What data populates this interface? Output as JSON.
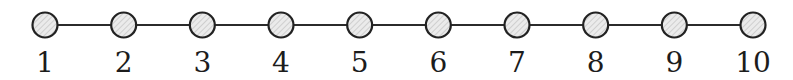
{
  "diagram": {
    "type": "path-graph",
    "nodes": [
      {
        "id": 1,
        "label": "1"
      },
      {
        "id": 2,
        "label": "2"
      },
      {
        "id": 3,
        "label": "3"
      },
      {
        "id": 4,
        "label": "4"
      },
      {
        "id": 5,
        "label": "5"
      },
      {
        "id": 6,
        "label": "6"
      },
      {
        "id": 7,
        "label": "7"
      },
      {
        "id": 8,
        "label": "8"
      },
      {
        "id": 9,
        "label": "9"
      },
      {
        "id": 10,
        "label": "10"
      }
    ],
    "edges": [
      [
        1,
        2
      ],
      [
        2,
        3
      ],
      [
        3,
        4
      ],
      [
        4,
        5
      ],
      [
        5,
        6
      ],
      [
        6,
        7
      ],
      [
        7,
        8
      ],
      [
        8,
        9
      ],
      [
        9,
        10
      ]
    ],
    "style": {
      "node_fill_base": "#ebebeb",
      "node_fill_hatch": "#b9b9b9",
      "node_stroke": "#222222",
      "edge_color": "#2b2b2b",
      "label_color": "#1c1c1c"
    }
  }
}
